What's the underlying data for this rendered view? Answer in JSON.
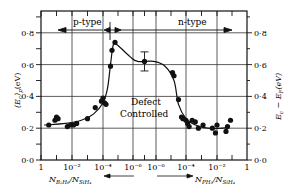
{
  "chart_data": {
    "type": "scatter",
    "title": "",
    "xlabel_left": "N_B2H6 / N_SiH4",
    "xlabel_right": "N_PH3 / N_SiH4",
    "ylabel_left": "(E_c)_p (eV)",
    "ylabel_right": "E_c − E_F (eV)",
    "ylim": [
      0.0,
      0.9
    ],
    "grid": true,
    "x_tick_labels": [
      "1",
      "10⁻²",
      "10⁻⁴",
      "10⁻⁶",
      "10⁻⁶",
      "10⁻⁴",
      "10⁻²",
      "1"
    ],
    "y_tick_labels": [
      "0·0",
      "0·2",
      "0·4",
      "0·6",
      "0·8"
    ],
    "y_ticks": [
      0.0,
      0.2,
      0.4,
      0.6,
      0.8
    ],
    "regions": [
      {
        "label": "p-type",
        "direction": "left"
      },
      {
        "label": "n-type",
        "direction": "right"
      }
    ],
    "annotations": [
      "Defect",
      "Controlled"
    ],
    "x_position_note": "x = horizontal position index 0..7 mapping to tick labels (log scale, p-doping on left, n-doping on right)",
    "series": [
      {
        "name": "p-type data",
        "points": [
          {
            "x": 0.25,
            "y": 0.22
          },
          {
            "x": 0.45,
            "y": 0.25
          },
          {
            "x": 0.5,
            "y": 0.27
          },
          {
            "x": 0.55,
            "y": 0.26
          },
          {
            "x": 0.85,
            "y": 0.21
          },
          {
            "x": 0.95,
            "y": 0.22
          },
          {
            "x": 1.05,
            "y": 0.22
          },
          {
            "x": 1.15,
            "y": 0.23
          },
          {
            "x": 1.5,
            "y": 0.26
          },
          {
            "x": 1.75,
            "y": 0.33
          },
          {
            "x": 1.95,
            "y": 0.37
          },
          {
            "x": 2.05,
            "y": 0.36
          },
          {
            "x": 2.1,
            "y": 0.35
          },
          {
            "x": 2.0,
            "y": 0.39
          },
          {
            "x": 2.25,
            "y": 0.59
          },
          {
            "x": 2.3,
            "y": 0.69
          },
          {
            "x": 2.4,
            "y": 0.74
          }
        ]
      },
      {
        "name": "defect controlled",
        "points": [
          {
            "x": 3.5,
            "y": 0.62,
            "error": 0.06
          }
        ]
      },
      {
        "name": "n-type data",
        "points": [
          {
            "x": 4.55,
            "y": 0.55
          },
          {
            "x": 4.6,
            "y": 0.53
          },
          {
            "x": 4.75,
            "y": 0.38
          },
          {
            "x": 4.85,
            "y": 0.27
          },
          {
            "x": 4.9,
            "y": 0.26
          },
          {
            "x": 5.0,
            "y": 0.25
          },
          {
            "x": 5.05,
            "y": 0.23
          },
          {
            "x": 5.1,
            "y": 0.21
          },
          {
            "x": 5.2,
            "y": 0.25
          },
          {
            "x": 5.3,
            "y": 0.24
          },
          {
            "x": 5.4,
            "y": 0.2
          },
          {
            "x": 5.55,
            "y": 0.22
          },
          {
            "x": 5.85,
            "y": 0.2
          },
          {
            "x": 5.95,
            "y": 0.17
          },
          {
            "x": 6.0,
            "y": 0.22
          },
          {
            "x": 6.3,
            "y": 0.18
          },
          {
            "x": 6.35,
            "y": 0.21
          },
          {
            "x": 6.45,
            "y": 0.25
          }
        ]
      }
    ],
    "fit_curve": [
      [
        0.1,
        0.22
      ],
      [
        0.8,
        0.23
      ],
      [
        1.3,
        0.25
      ],
      [
        1.7,
        0.29
      ],
      [
        2.0,
        0.36
      ],
      [
        2.15,
        0.45
      ],
      [
        2.25,
        0.6
      ],
      [
        2.35,
        0.73
      ],
      [
        2.5,
        0.72
      ],
      [
        2.9,
        0.65
      ],
      [
        3.2,
        0.62
      ],
      [
        3.9,
        0.62
      ],
      [
        4.3,
        0.59
      ],
      [
        4.6,
        0.5
      ],
      [
        4.75,
        0.35
      ],
      [
        5.0,
        0.26
      ],
      [
        5.3,
        0.22
      ],
      [
        5.7,
        0.2
      ],
      [
        6.2,
        0.2
      ],
      [
        6.35,
        0.21
      ]
    ]
  },
  "labels": {
    "p_type": "p-type",
    "n_type": "n-type",
    "defect": "Defect",
    "controlled": "Controlled",
    "x_left_num": "N",
    "x_left_num_sub": "B₂H₆",
    "x_left_den": "/N",
    "x_left_den_sub": "SiH₄",
    "x_right_num": "N",
    "x_right_num_sub": "PH₃",
    "x_right_den": "/N",
    "x_right_den_sub": "SiH₄",
    "y_left": "(E",
    "y_left_sub": "c",
    "y_left_rest": ")",
    "y_left_sub2": "p",
    "y_left_unit": "(eV)",
    "y_right": "E",
    "y_right_sub": "c",
    "y_right_mid": " − E",
    "y_right_sub2": "F",
    "y_right_unit": "(eV)"
  }
}
